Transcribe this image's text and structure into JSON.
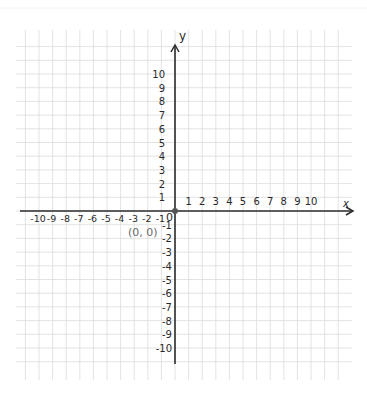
{
  "diagram": {
    "type": "coordinate-plane",
    "axes": {
      "x_label": "x",
      "y_label": "y",
      "x_ticks_positive": [
        "1",
        "2",
        "3",
        "4",
        "5",
        "6",
        "7",
        "8",
        "9",
        "10"
      ],
      "x_ticks_negative": [
        "-10",
        "-9",
        "-8",
        "-7",
        "-6",
        "-5",
        "-4",
        "-3",
        "-2",
        "-1"
      ],
      "y_ticks_positive": [
        "1",
        "2",
        "3",
        "4",
        "5",
        "6",
        "7",
        "8",
        "9",
        "10"
      ],
      "y_ticks_negative": [
        "-1",
        "-2",
        "-3",
        "-4",
        "-5",
        "-6",
        "-7",
        "-8",
        "-9",
        "-10"
      ],
      "origin_label": "0",
      "x_range": [
        -10,
        10
      ],
      "y_range": [
        -10,
        10
      ]
    },
    "origin_point": {
      "label": "(0, 0)",
      "x": 0,
      "y": 0
    },
    "grid": {
      "on": true,
      "color": "#dcdcdc"
    },
    "colors": {
      "axis": "#2b2b2b",
      "text": "#2a2a2a",
      "origin_dot": "#555555",
      "origin_label": "#6a6a6a"
    }
  }
}
